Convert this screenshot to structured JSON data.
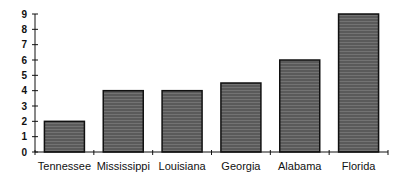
{
  "chart_data": {
    "type": "bar",
    "title": "",
    "xlabel": "",
    "ylabel": "",
    "categories": [
      "Tennessee",
      "Mississippi",
      "Louisiana",
      "Georgia",
      "Alabama",
      "Florida"
    ],
    "values": [
      2,
      4,
      4,
      4.5,
      6,
      9
    ],
    "ylim": [
      0,
      9
    ],
    "yticks": [
      0,
      1,
      2,
      3,
      4,
      5,
      6,
      7,
      8,
      9
    ],
    "grid": false,
    "legend": null,
    "bar_color": "#5a5a5a",
    "bar_edge_color": "#111111"
  }
}
